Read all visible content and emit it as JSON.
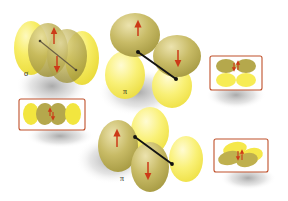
{
  "figure": {
    "background_color": "#ffffff"
  },
  "palette": {
    "lobe_pale": "#f5e63c",
    "lobe_pale_light": "#faf07a",
    "lobe_olive": "#b8ab4a",
    "lobe_olive_light": "#d6cc86",
    "arrow_red": "#cc3a18",
    "bond_axis": "#1a1a1a",
    "inset_border": "#c0502a",
    "inset_fill": "#ffffff",
    "shadow": "#9a9a9a",
    "label_color": "#231f20"
  },
  "labels": {
    "sigma": "σ",
    "pi_top": "π",
    "pi_bottom": "π"
  },
  "panels": [
    {
      "id": "sigma-bond",
      "label": "σ",
      "description": "head-on overlap of two orbitals forming a sigma bond",
      "arrows": [
        "up",
        "down"
      ],
      "lobe_count": 4
    },
    {
      "id": "pi-bond-top",
      "label": "π",
      "description": "side-on overlap of two p orbitals forming a pi bond",
      "arrows": [
        "up",
        "down"
      ],
      "lobe_count": 4
    },
    {
      "id": "pi-bond-bottom",
      "label": "π",
      "description": "second side-on overlap of two p orbitals forming a pi bond",
      "arrows": [
        "up",
        "down"
      ],
      "lobe_count": 4
    }
  ],
  "insets": [
    {
      "id": "inset-sigma",
      "description": "2D cross section of sigma overlap, four ellipses in a row",
      "ellipse_count": 4,
      "arrows": [
        "up",
        "down"
      ]
    },
    {
      "id": "inset-pi-top",
      "description": "2D cross section of pi overlap, two olive lobes above two pale lobes",
      "ellipse_count": 4,
      "arrows": [
        "up",
        "down"
      ]
    },
    {
      "id": "inset-pi-bottom",
      "description": "2D cross section of angled pi overlap",
      "ellipse_count": 4,
      "arrows": [
        "up",
        "down"
      ]
    }
  ]
}
